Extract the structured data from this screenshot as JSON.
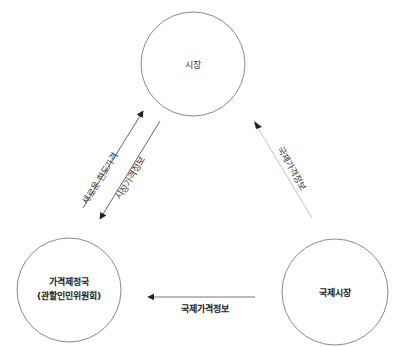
{
  "diagram": {
    "type": "flow",
    "nodes": [
      {
        "id": "market",
        "label": "시장"
      },
      {
        "id": "price_authority",
        "label_line1": "가격제정국",
        "label_line2": "(관할인민위원회)"
      },
      {
        "id": "intl_market",
        "label": "국제시장"
      }
    ],
    "edges": [
      {
        "from": "price_authority",
        "to": "market",
        "label": "새로운 한도가격"
      },
      {
        "from": "market",
        "to": "price_authority",
        "label": "시장가격정보"
      },
      {
        "from": "intl_market",
        "to": "market",
        "label": "국제가격정보"
      },
      {
        "from": "intl_market",
        "to": "price_authority",
        "label": "국제가격정보"
      }
    ]
  },
  "colors": {
    "stroke": "#7a7a7a",
    "arrow": "#222222",
    "faint_stroke": "#cfcfcf"
  }
}
